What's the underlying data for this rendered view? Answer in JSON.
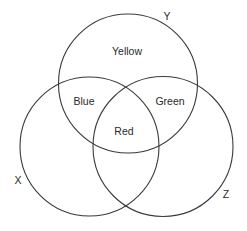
{
  "diagram": {
    "type": "venn",
    "sets": [
      {
        "id": "Y",
        "label": "Y",
        "cx": 128,
        "cy": 83.5,
        "r": 69.5,
        "label_x": 167,
        "label_y": 16
      },
      {
        "id": "X",
        "label": "X",
        "cx": 89.5,
        "cy": 146.5,
        "r": 69.5,
        "label_x": 18,
        "label_y": 180
      },
      {
        "id": "Z",
        "label": "Z",
        "cx": 163,
        "cy": 146.5,
        "r": 70,
        "label_x": 226,
        "label_y": 194
      }
    ],
    "regions": [
      {
        "sets": [
          "Y"
        ],
        "label": "Yellow",
        "x": 127,
        "y": 51
      },
      {
        "sets": [
          "X",
          "Y"
        ],
        "label": "Blue",
        "x": 84,
        "y": 101
      },
      {
        "sets": [
          "Y",
          "Z"
        ],
        "label": "Green",
        "x": 170,
        "y": 101
      },
      {
        "sets": [
          "X",
          "Y",
          "Z"
        ],
        "label": "Red",
        "x": 124,
        "y": 131
      }
    ],
    "colors": {
      "stroke": "#3a3a3a",
      "text": "#2a2a2a",
      "background": "#ffffff"
    }
  }
}
